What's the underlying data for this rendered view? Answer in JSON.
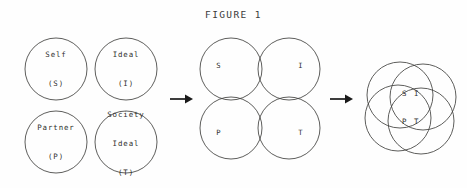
{
  "figure": {
    "title": "FIGURE 1",
    "background_color": "#fefefe",
    "stroke_color": "#41413f",
    "text_color": "#2f2f2d",
    "arrow_color": "#1a1a1a"
  },
  "stage_separate": {
    "name": "four separate circles",
    "circles": [
      {
        "id": "self",
        "lines": [
          "Self",
          "(S)"
        ],
        "line1": "Self",
        "line2": "(S)",
        "cx": 56,
        "cy": 69,
        "r": 31
      },
      {
        "id": "ideal",
        "lines": [
          "Ideal",
          "(I)"
        ],
        "line1": "Ideal",
        "line2": "(I)",
        "cx": 126,
        "cy": 69,
        "r": 31
      },
      {
        "id": "partner",
        "lines": [
          "Partner",
          "(P)"
        ],
        "line1": "Partner",
        "line2": "(P)",
        "cx": 56,
        "cy": 142,
        "r": 31
      },
      {
        "id": "society-ideal",
        "lines": [
          "Society",
          "Ideal",
          "(T)"
        ],
        "line1": "Society",
        "line2": "Ideal",
        "line3": "(T)",
        "cx": 126,
        "cy": 142,
        "r": 31
      }
    ]
  },
  "arrow_one": {
    "name": "arrow from separate circles to partial overlap",
    "glyph": "arrow-right"
  },
  "stage_partial_overlap": {
    "name": "four partially overlapping circles",
    "circles": [
      {
        "id": "s",
        "label": "S",
        "cx": 231,
        "cy": 69,
        "r": 31
      },
      {
        "id": "i",
        "label": "I",
        "cx": 289,
        "cy": 69,
        "r": 31
      },
      {
        "id": "p",
        "label": "P",
        "cx": 231,
        "cy": 128,
        "r": 31
      },
      {
        "id": "t",
        "label": "T",
        "cx": 289,
        "cy": 128,
        "r": 31
      }
    ],
    "label_positions": [
      {
        "id": "s",
        "x": 219,
        "y": 66
      },
      {
        "id": "i",
        "x": 301,
        "y": 66
      },
      {
        "id": "p",
        "x": 219,
        "y": 133
      },
      {
        "id": "t",
        "x": 301,
        "y": 133
      }
    ]
  },
  "arrow_two": {
    "name": "arrow from partial overlap to full overlap",
    "glyph": "arrow-right"
  },
  "stage_full_overlap": {
    "name": "four heavily overlapping circles",
    "circles": [
      {
        "id": "s",
        "cx": 400,
        "cy": 95,
        "r": 33
      },
      {
        "id": "i",
        "cx": 423,
        "cy": 97,
        "r": 33
      },
      {
        "id": "p",
        "cx": 398,
        "cy": 118,
        "r": 33
      },
      {
        "id": "t",
        "cx": 421,
        "cy": 121,
        "r": 33
      }
    ],
    "center_label": {
      "line1": "S I",
      "line2": "P T",
      "x": 411,
      "y": 108
    }
  }
}
